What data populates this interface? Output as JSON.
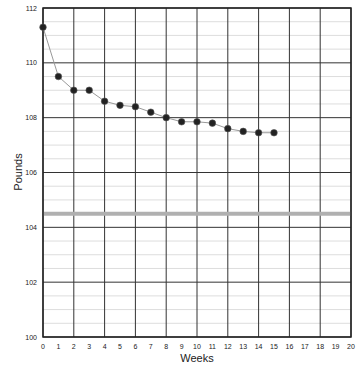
{
  "chart_data": {
    "type": "line",
    "title": "",
    "xlabel": "Weeks",
    "ylabel": "Pounds",
    "xlim": [
      0,
      20
    ],
    "ylim": [
      100,
      112
    ],
    "x_ticks": [
      0,
      1,
      2,
      3,
      4,
      5,
      6,
      7,
      8,
      9,
      10,
      11,
      12,
      13,
      14,
      15,
      16,
      17,
      18,
      19,
      20
    ],
    "y_ticks": [
      100,
      102,
      104,
      106,
      108,
      110,
      112
    ],
    "grid": true,
    "legend": null,
    "series": [
      {
        "name": "Weight",
        "x": [
          0,
          1,
          2,
          3,
          4,
          5,
          6,
          7,
          8,
          9,
          10,
          11,
          12,
          13,
          14,
          15
        ],
        "values": [
          111.3,
          109.5,
          109.0,
          109.0,
          108.6,
          108.45,
          108.4,
          108.2,
          108.0,
          107.85,
          107.85,
          107.8,
          107.6,
          107.5,
          107.45,
          107.45
        ]
      }
    ],
    "reference_lines": [
      {
        "y": 104.5,
        "color": "#b0b0b0"
      }
    ],
    "colors": {
      "line": "#999999",
      "marker": "#222222",
      "grid_major": "#333333",
      "grid_minor": "#dddddd",
      "goal_line": "#b0b0b0"
    }
  }
}
